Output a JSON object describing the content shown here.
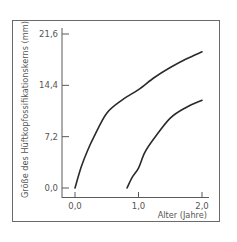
{
  "chart_data": {
    "type": "line",
    "title": "",
    "xlabel": "Alter (Jahre)",
    "ylabel": "Größe des Hüftkopfossifikationskerns (mm)",
    "xlim": [
      0.0,
      2.0
    ],
    "ylim": [
      0.0,
      21.6
    ],
    "x_ticks": [
      "0,0",
      "1,0",
      "2,0"
    ],
    "y_ticks": [
      "0,0",
      "7,2",
      "14,4",
      "21,6"
    ],
    "grid": false,
    "legend": null,
    "series": [
      {
        "name": "upper curve",
        "x": [
          0.0,
          0.1,
          0.2,
          0.3,
          0.5,
          0.75,
          1.0,
          1.25,
          1.5,
          1.75,
          2.0
        ],
        "values": [
          0.0,
          3.0,
          5.3,
          7.2,
          10.5,
          12.4,
          13.8,
          15.5,
          16.9,
          18.1,
          19.1
        ]
      },
      {
        "name": "lower curve",
        "x": [
          0.82,
          0.9,
          1.0,
          1.1,
          1.25,
          1.5,
          1.75,
          2.0
        ],
        "values": [
          0.0,
          1.5,
          2.8,
          5.0,
          7.0,
          9.8,
          11.3,
          12.3
        ]
      }
    ]
  }
}
